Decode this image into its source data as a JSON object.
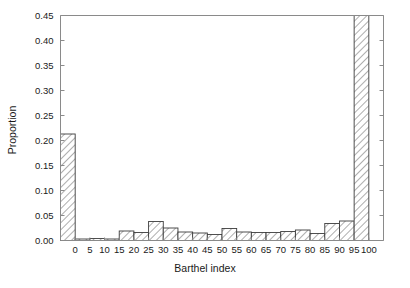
{
  "chart_data": {
    "type": "bar",
    "title": "",
    "subtitle": "",
    "xlabel": "Barthel index",
    "ylabel": "Proportion",
    "grid": false,
    "legend": null,
    "xlim": [
      -5,
      105
    ],
    "ylim": [
      0.0,
      0.45
    ],
    "bin_width": 5,
    "x_tick_labels": [
      "0",
      "5",
      "10",
      "15",
      "20",
      "25",
      "30",
      "35",
      "40",
      "45",
      "50",
      "55",
      "60",
      "65",
      "70",
      "75",
      "80",
      "85",
      "90",
      "95",
      "100"
    ],
    "x_tick_values": [
      0,
      5,
      10,
      15,
      20,
      25,
      30,
      35,
      40,
      45,
      50,
      55,
      60,
      65,
      70,
      75,
      80,
      85,
      90,
      95,
      100
    ],
    "y_tick_labels": [
      "0.00",
      "0.05",
      "0.10",
      "0.15",
      "0.20",
      "0.25",
      "0.30",
      "0.35",
      "0.40",
      "0.45"
    ],
    "y_tick_values": [
      0.0,
      0.05,
      0.1,
      0.15,
      0.2,
      0.25,
      0.3,
      0.35,
      0.4,
      0.45
    ],
    "bin_left_edges": [
      -5,
      0,
      5,
      10,
      15,
      20,
      25,
      30,
      35,
      40,
      45,
      50,
      55,
      60,
      65,
      70,
      75,
      80,
      85,
      90,
      95,
      100
    ],
    "categories": [
      "-5 to 0",
      "0 to 5",
      "5 to 10",
      "10 to 15",
      "15 to 20",
      "20 to 25",
      "25 to 30",
      "30 to 35",
      "35 to 40",
      "40 to 45",
      "45 to 50",
      "50 to 55",
      "55 to 60",
      "60 to 65",
      "65 to 70",
      "70 to 75",
      "75 to 80",
      "80 to 85",
      "85 to 90",
      "90 to 95",
      "95 to 100",
      "100 to 105"
    ],
    "values": [
      0.213,
      0.003,
      0.004,
      0.003,
      0.019,
      0.016,
      0.038,
      0.025,
      0.017,
      0.015,
      0.012,
      0.024,
      0.017,
      0.016,
      0.016,
      0.018,
      0.021,
      0.014,
      0.034,
      0.039,
      0.45,
      0.0
    ],
    "bar_style": {
      "fill": "#ffffff",
      "hatch": "diagonal-forward",
      "hatch_color": "#6b6b6b",
      "edge_color": "#3d3d3d"
    },
    "axis_color": "#8a8a8a",
    "text_color": "#1a1a1a"
  },
  "figure": {
    "background": "#ffffff",
    "caption": ""
  }
}
